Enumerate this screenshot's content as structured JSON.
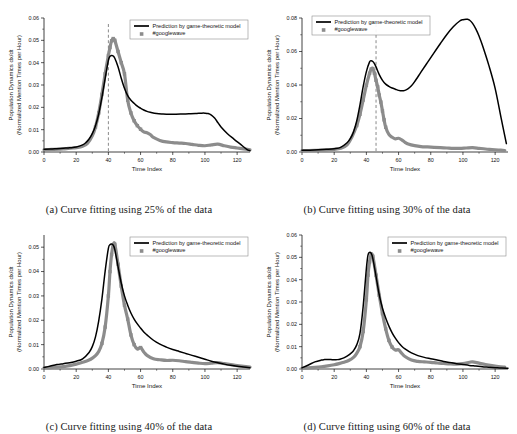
{
  "figure": {
    "background_color": "#ffffff",
    "line_color": "#000000",
    "marker_color": "#8c8c8c",
    "cutline_color": "#8a8a8a"
  },
  "common": {
    "xlabel": "Time Index",
    "ylabel_line1": "Population Dynamics dx/dt",
    "ylabel_line2": "(Normalized Mention Times per Hour)",
    "legend_model": "Prediction by game-theoretic model",
    "legend_data": "#googlewave",
    "xticks": [
      "0",
      "20",
      "40",
      "60",
      "80",
      "100",
      "120"
    ],
    "xtick_values": [
      0,
      20,
      40,
      60,
      80,
      100,
      120
    ],
    "xlim": [
      0,
      128
    ]
  },
  "chart_data": [
    {
      "id": "a",
      "type": "line",
      "title": "",
      "caption": "(a)  Curve fitting using 25% of the data",
      "xlabel": "Time Index",
      "ylabel": "Population Dynamics dx/dt (Normalized Mention Times per Hour)",
      "xlim": [
        0,
        128
      ],
      "ylim": [
        0.0,
        0.06
      ],
      "yticks": [
        "0.00",
        "0.01",
        "0.02",
        "0.03",
        "0.04",
        "0.05",
        "0.06"
      ],
      "ytick_values": [
        0.0,
        0.01,
        0.02,
        0.03,
        0.04,
        0.05,
        0.06
      ],
      "grid": false,
      "legend_position": "top-right",
      "training_cutoff_x": 40,
      "training_fraction_percent": 25,
      "series": [
        {
          "name": "Prediction by game-theoretic model",
          "style": "solid-line",
          "x": [
            0,
            4,
            8,
            12,
            16,
            20,
            24,
            26,
            28,
            30,
            32,
            34,
            36,
            38,
            40,
            41,
            42,
            43,
            44,
            46,
            48,
            50,
            52,
            54,
            56,
            58,
            60,
            62,
            64,
            66,
            70,
            74,
            78,
            82,
            86,
            90,
            94,
            98,
            100,
            102,
            104,
            106,
            108,
            110,
            114,
            118,
            122,
            126,
            128
          ],
          "values": [
            0.0012,
            0.0013,
            0.0015,
            0.0017,
            0.0019,
            0.0022,
            0.0032,
            0.0042,
            0.0058,
            0.0082,
            0.0118,
            0.017,
            0.0245,
            0.033,
            0.041,
            0.0428,
            0.0432,
            0.043,
            0.042,
            0.0382,
            0.033,
            0.0285,
            0.0252,
            0.0232,
            0.0218,
            0.0205,
            0.0196,
            0.0188,
            0.0182,
            0.0178,
            0.0172,
            0.017,
            0.0169,
            0.0169,
            0.017,
            0.0171,
            0.0172,
            0.0174,
            0.0174,
            0.0172,
            0.0165,
            0.0152,
            0.0132,
            0.0112,
            0.0082,
            0.0058,
            0.0035,
            0.0012,
            0.0006
          ]
        },
        {
          "name": "#googlewave",
          "style": "square-markers",
          "x": [
            0,
            3,
            6,
            9,
            12,
            15,
            18,
            21,
            24,
            27,
            30,
            32,
            34,
            36,
            38,
            40,
            41,
            42,
            43,
            44,
            46,
            48,
            50,
            52,
            54,
            56,
            58,
            60,
            62,
            64,
            66,
            68,
            72,
            76,
            80,
            84,
            88,
            92,
            96,
            100,
            104,
            108,
            112,
            116,
            120,
            124,
            128
          ],
          "values": [
            0.001,
            0.0011,
            0.0012,
            0.0013,
            0.0014,
            0.0016,
            0.0018,
            0.002,
            0.0026,
            0.0038,
            0.0072,
            0.0112,
            0.0175,
            0.0258,
            0.035,
            0.0432,
            0.0468,
            0.0498,
            0.0508,
            0.05,
            0.045,
            0.04,
            0.035,
            0.0232,
            0.0175,
            0.014,
            0.0118,
            0.0102,
            0.009,
            0.0086,
            0.0078,
            0.0065,
            0.0052,
            0.0045,
            0.0042,
            0.004,
            0.0038,
            0.0034,
            0.003,
            0.0028,
            0.0032,
            0.0035,
            0.0028,
            0.0022,
            0.0018,
            0.0014,
            0.001
          ]
        }
      ]
    },
    {
      "id": "b",
      "type": "line",
      "title": "",
      "caption": "(b)  Curve fitting using 30% of the data",
      "xlabel": "Time Index",
      "ylabel": "Population Dynamics dx/dt (Normalized Mention Times per Hour)",
      "xlim": [
        0,
        128
      ],
      "ylim": [
        0.0,
        0.08
      ],
      "yticks": [
        "0.00",
        "0.02",
        "0.04",
        "0.06",
        "0.08"
      ],
      "ytick_values": [
        0.0,
        0.02,
        0.04,
        0.06,
        0.08
      ],
      "grid": false,
      "legend_position": "top-left",
      "training_cutoff_x": 46,
      "training_fraction_percent": 30,
      "series": [
        {
          "name": "Prediction by game-theoretic model",
          "style": "solid-line",
          "x": [
            0,
            5,
            10,
            15,
            20,
            24,
            28,
            30,
            32,
            34,
            36,
            38,
            40,
            42,
            43,
            44,
            45,
            46,
            48,
            50,
            52,
            54,
            56,
            58,
            60,
            62,
            64,
            66,
            68,
            70,
            74,
            78,
            82,
            86,
            90,
            94,
            98,
            100,
            102,
            103,
            104,
            106,
            108,
            110,
            112,
            116,
            120,
            124,
            127
          ],
          "values": [
            0.001,
            0.0011,
            0.0013,
            0.0016,
            0.002,
            0.0028,
            0.0055,
            0.008,
            0.012,
            0.0185,
            0.028,
            0.039,
            0.048,
            0.0538,
            0.0545,
            0.054,
            0.0528,
            0.0508,
            0.0462,
            0.0428,
            0.0405,
            0.0392,
            0.0382,
            0.0375,
            0.0368,
            0.0365,
            0.0368,
            0.0378,
            0.0395,
            0.042,
            0.0478,
            0.0535,
            0.0592,
            0.0648,
            0.0702,
            0.0748,
            0.0782,
            0.079,
            0.0793,
            0.0792,
            0.0788,
            0.0768,
            0.0735,
            0.0692,
            0.064,
            0.052,
            0.038,
            0.019,
            0.005
          ]
        },
        {
          "name": "#googlewave",
          "style": "square-markers",
          "x": [
            0,
            4,
            8,
            12,
            16,
            20,
            24,
            28,
            31,
            34,
            36,
            38,
            40,
            42,
            43,
            44,
            45,
            46,
            47,
            48,
            49,
            50,
            51,
            52,
            54,
            56,
            58,
            60,
            62,
            64,
            66,
            70,
            74,
            78,
            82,
            86,
            90,
            94,
            98,
            102,
            106,
            110,
            114,
            118,
            122,
            126
          ],
          "values": [
            0.0008,
            0.0009,
            0.001,
            0.0011,
            0.0013,
            0.0016,
            0.0022,
            0.0042,
            0.009,
            0.0158,
            0.0225,
            0.031,
            0.0398,
            0.047,
            0.0495,
            0.0498,
            0.047,
            0.0428,
            0.039,
            0.034,
            0.0298,
            0.0245,
            0.0192,
            0.0148,
            0.0105,
            0.0088,
            0.0078,
            0.0082,
            0.0072,
            0.0058,
            0.0048,
            0.0038,
            0.0032,
            0.003,
            0.0028,
            0.0026,
            0.0024,
            0.0022,
            0.0022,
            0.0024,
            0.0026,
            0.0022,
            0.0018,
            0.0015,
            0.0012,
            0.0009
          ]
        }
      ]
    },
    {
      "id": "c",
      "type": "line",
      "title": "",
      "caption": "(c)  Curve fitting using 40% of the data",
      "xlabel": "Time Index",
      "ylabel": "Population Dynamics dx/dt (Normalized Mention Times per Hour)",
      "xlim": [
        0,
        128
      ],
      "ylim": [
        0.0,
        0.055
      ],
      "yticks": [
        "0.00",
        "0.01",
        "0.02",
        "0.03",
        "0.04",
        "0.05"
      ],
      "ytick_values": [
        0.0,
        0.01,
        0.02,
        0.03,
        0.04,
        0.05
      ],
      "grid": false,
      "legend_position": "top-right",
      "training_cutoff_x": null,
      "training_fraction_percent": 40,
      "series": [
        {
          "name": "Prediction by game-theoretic model",
          "style": "solid-line",
          "x": [
            0,
            4,
            8,
            12,
            16,
            20,
            24,
            28,
            30,
            32,
            34,
            36,
            38,
            40,
            41,
            42,
            43,
            44,
            46,
            48,
            50,
            52,
            54,
            56,
            58,
            60,
            62,
            64,
            68,
            72,
            76,
            80,
            84,
            88,
            92,
            96,
            100,
            104,
            108,
            112,
            116,
            120,
            124,
            128
          ],
          "values": [
            0.0006,
            0.0012,
            0.0018,
            0.0022,
            0.0026,
            0.0032,
            0.0042,
            0.0068,
            0.0092,
            0.0132,
            0.0198,
            0.0288,
            0.0402,
            0.0495,
            0.051,
            0.0513,
            0.0508,
            0.049,
            0.042,
            0.0352,
            0.03,
            0.0262,
            0.023,
            0.0205,
            0.0185,
            0.0168,
            0.0152,
            0.014,
            0.0118,
            0.0102,
            0.009,
            0.008,
            0.0072,
            0.0064,
            0.0056,
            0.0048,
            0.004,
            0.0032,
            0.0026,
            0.002,
            0.0015,
            0.0011,
            0.0008,
            0.0005
          ]
        },
        {
          "name": "#googlewave",
          "style": "square-markers",
          "x": [
            0,
            4,
            8,
            12,
            16,
            20,
            23,
            26,
            29,
            32,
            34,
            36,
            38,
            40,
            41,
            42,
            43,
            44,
            46,
            48,
            50,
            52,
            54,
            56,
            58,
            60,
            62,
            64,
            68,
            72,
            76,
            80,
            84,
            88,
            92,
            96,
            100,
            104,
            108,
            112,
            116,
            120,
            124,
            128
          ],
          "values": [
            0.0005,
            0.0006,
            0.0008,
            0.001,
            0.0014,
            0.002,
            0.0026,
            0.0032,
            0.004,
            0.0055,
            0.0072,
            0.0105,
            0.0172,
            0.03,
            0.04,
            0.047,
            0.0508,
            0.0512,
            0.043,
            0.034,
            0.0262,
            0.0205,
            0.014,
            0.01,
            0.0082,
            0.0088,
            0.007,
            0.0056,
            0.0042,
            0.0038,
            0.0035,
            0.0036,
            0.0034,
            0.003,
            0.0027,
            0.0024,
            0.0022,
            0.0024,
            0.0026,
            0.0022,
            0.0018,
            0.0014,
            0.0011,
            0.0008
          ]
        }
      ]
    },
    {
      "id": "d",
      "type": "line",
      "title": "",
      "caption": "(d)  Curve fitting using 60% of the data",
      "xlabel": "Time Index",
      "ylabel": "Population Dynamics dx/dt (Normalized Mention Times per Hour)",
      "xlim": [
        0,
        128
      ],
      "ylim": [
        0.0,
        0.06
      ],
      "yticks": [
        "0.00",
        "0.01",
        "0.02",
        "0.03",
        "0.04",
        "0.05",
        "0.06"
      ],
      "ytick_values": [
        0.0,
        0.01,
        0.02,
        0.03,
        0.04,
        0.05,
        0.06
      ],
      "grid": false,
      "legend_position": "top-right",
      "training_cutoff_x": null,
      "training_fraction_percent": 60,
      "series": [
        {
          "name": "Prediction by game-theoretic model",
          "style": "solid-line",
          "x": [
            0,
            4,
            8,
            12,
            14,
            16,
            18,
            20,
            22,
            24,
            26,
            28,
            30,
            32,
            34,
            36,
            38,
            40,
            41,
            42,
            43,
            44,
            46,
            48,
            50,
            52,
            54,
            56,
            58,
            60,
            62,
            64,
            68,
            72,
            76,
            80,
            84,
            88,
            92,
            96,
            100,
            104,
            108,
            112,
            116,
            120,
            124,
            128
          ],
          "values": [
            0.0005,
            0.0018,
            0.0032,
            0.004,
            0.0042,
            0.0043,
            0.0042,
            0.0041,
            0.0042,
            0.0045,
            0.005,
            0.0058,
            0.0068,
            0.0082,
            0.0108,
            0.0158,
            0.028,
            0.045,
            0.051,
            0.0522,
            0.0518,
            0.0495,
            0.0415,
            0.0332,
            0.0272,
            0.0228,
            0.0192,
            0.0162,
            0.0138,
            0.0118,
            0.0102,
            0.009,
            0.0072,
            0.006,
            0.0052,
            0.0046,
            0.004,
            0.0034,
            0.0029,
            0.0024,
            0.002,
            0.0016,
            0.0013,
            0.001,
            0.0008,
            0.0006,
            0.0004,
            0.0003
          ]
        },
        {
          "name": "#googlewave",
          "style": "square-markers",
          "x": [
            0,
            4,
            8,
            12,
            16,
            20,
            23,
            26,
            29,
            32,
            34,
            36,
            38,
            40,
            41,
            42,
            43,
            44,
            46,
            48,
            50,
            52,
            54,
            56,
            58,
            60,
            62,
            64,
            68,
            72,
            76,
            80,
            84,
            88,
            92,
            96,
            100,
            104,
            106,
            110,
            114,
            118,
            122,
            126
          ],
          "values": [
            0.0004,
            0.0005,
            0.0007,
            0.001,
            0.0014,
            0.0019,
            0.0024,
            0.003,
            0.0038,
            0.0052,
            0.007,
            0.01,
            0.0168,
            0.031,
            0.042,
            0.048,
            0.0512,
            0.0505,
            0.042,
            0.033,
            0.0248,
            0.018,
            0.0128,
            0.0098,
            0.0085,
            0.0086,
            0.007,
            0.0056,
            0.004,
            0.0034,
            0.0032,
            0.003,
            0.0027,
            0.0025,
            0.0023,
            0.0022,
            0.0024,
            0.003,
            0.0032,
            0.0026,
            0.002,
            0.0015,
            0.0011,
            0.0008
          ]
        }
      ]
    }
  ]
}
